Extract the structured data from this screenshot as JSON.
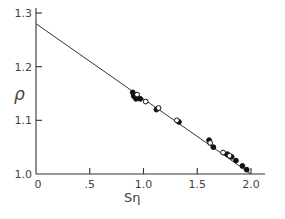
{
  "chart_data": {
    "type": "scatter",
    "title": "",
    "xlabel": "Sη",
    "ylabel": "ρ",
    "xlim": [
      0,
      2.2
    ],
    "ylim": [
      1.0,
      1.3
    ],
    "x_ticks": [
      0,
      0.5,
      1.0,
      1.5,
      2.0
    ],
    "x_tick_labels": [
      "0",
      ".5",
      "1.0",
      "1.5",
      "2.0"
    ],
    "y_ticks": [
      1.0,
      1.1,
      1.2,
      1.3
    ],
    "y_tick_labels": [
      "1.0",
      "1.1",
      "1.2",
      "1.3"
    ],
    "grid": false,
    "legend": null,
    "fit_line": {
      "x": [
        0,
        2.0
      ],
      "y": [
        1.28,
        1.0
      ]
    },
    "series": [
      {
        "name": "filled",
        "marker": "filled-circle",
        "points": [
          [
            0.9,
            1.152
          ],
          [
            0.91,
            1.145
          ],
          [
            0.93,
            1.14
          ],
          [
            0.97,
            1.14
          ],
          [
            1.12,
            1.12
          ],
          [
            1.33,
            1.097
          ],
          [
            1.61,
            1.063
          ],
          [
            1.65,
            1.05
          ],
          [
            1.78,
            1.037
          ],
          [
            1.82,
            1.032
          ],
          [
            1.86,
            1.025
          ],
          [
            1.92,
            1.015
          ],
          [
            1.96,
            1.008
          ]
        ]
      },
      {
        "name": "open",
        "marker": "open-circle",
        "points": [
          [
            0.94,
            1.148
          ],
          [
            1.02,
            1.135
          ],
          [
            1.14,
            1.123
          ],
          [
            1.31,
            1.1
          ],
          [
            1.62,
            1.058
          ],
          [
            1.74,
            1.04
          ],
          [
            1.8,
            1.034
          ]
        ]
      }
    ]
  }
}
